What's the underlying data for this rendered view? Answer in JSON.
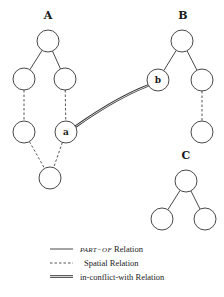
{
  "diagram": {
    "trees": [
      {
        "label": "A",
        "label_pos": [
          48,
          19
        ]
      },
      {
        "label": "B",
        "label_pos": [
          183,
          19
        ]
      },
      {
        "label": "C",
        "label_pos": [
          186,
          159
        ]
      }
    ],
    "nodes": [
      {
        "id": "A_root",
        "x": 48,
        "y": 41,
        "label": ""
      },
      {
        "id": "A_l",
        "x": 24,
        "y": 79,
        "label": ""
      },
      {
        "id": "A_r",
        "x": 65,
        "y": 79,
        "label": ""
      },
      {
        "id": "A_ll",
        "x": 24,
        "y": 132,
        "label": ""
      },
      {
        "id": "a",
        "x": 66,
        "y": 132,
        "label": "a"
      },
      {
        "id": "A_bottom",
        "x": 50,
        "y": 178,
        "label": ""
      },
      {
        "id": "B_root",
        "x": 182,
        "y": 41,
        "label": ""
      },
      {
        "id": "b",
        "x": 158,
        "y": 80,
        "label": "b"
      },
      {
        "id": "B_r",
        "x": 202,
        "y": 80,
        "label": ""
      },
      {
        "id": "B_rr",
        "x": 202,
        "y": 132,
        "label": ""
      },
      {
        "id": "C_root",
        "x": 186,
        "y": 181,
        "label": ""
      },
      {
        "id": "C_l",
        "x": 162,
        "y": 219,
        "label": ""
      },
      {
        "id": "C_r",
        "x": 205,
        "y": 219,
        "label": ""
      }
    ],
    "node_radius": 11,
    "part_of_edges": [
      [
        "A_root",
        "A_l"
      ],
      [
        "A_root",
        "A_r"
      ],
      [
        "B_root",
        "b"
      ],
      [
        "B_root",
        "B_r"
      ],
      [
        "C_root",
        "C_l"
      ],
      [
        "C_root",
        "C_r"
      ]
    ],
    "spatial_edges": [
      [
        "A_l",
        "A_ll"
      ],
      [
        "A_r",
        "a"
      ],
      [
        "A_ll",
        "A_bottom"
      ],
      [
        "a",
        "A_bottom"
      ],
      [
        "B_r",
        "B_rr"
      ]
    ],
    "conflict_edges": [
      [
        "a",
        "b"
      ]
    ]
  },
  "legend": {
    "items": [
      {
        "type": "part-of",
        "label_italic": "PART−OF",
        "label": " Relation"
      },
      {
        "type": "spatial",
        "label": "Spatial Relation"
      },
      {
        "type": "conflict",
        "label": "in-conflict-with Relation"
      }
    ]
  }
}
